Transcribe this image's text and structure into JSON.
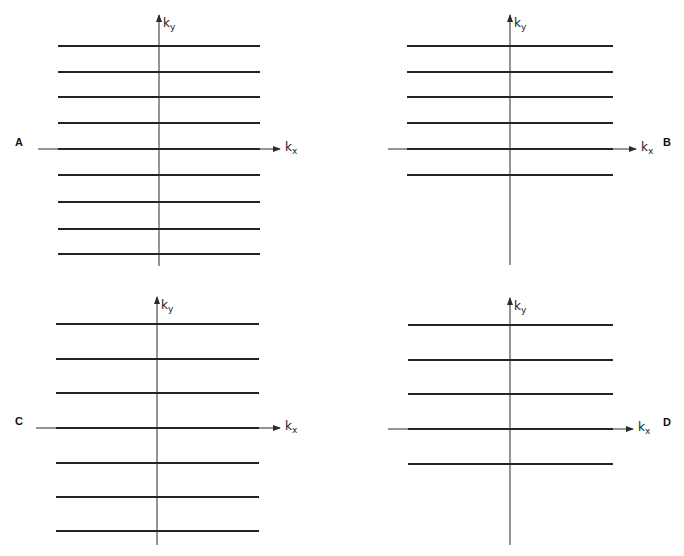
{
  "figure": {
    "axis_labels": {
      "x_main": "k",
      "x_sub": "x",
      "y_main": "k",
      "y_sub": "y"
    },
    "colors": {
      "line": "#232323",
      "axis": "#2a2a2a",
      "background": "#ffffff"
    }
  },
  "panels": [
    {
      "id": "A",
      "letter": "A",
      "letter_side": "left",
      "origin": [
        159,
        149
      ],
      "line_x_range": [
        58,
        260
      ],
      "axis_x_range": [
        38,
        280
      ],
      "axis_y_range": [
        15,
        266
      ],
      "line_y": [
        46,
        72,
        97,
        123,
        149,
        175,
        202,
        229,
        254
      ],
      "line_count": 9,
      "spacing": "narrow",
      "coverage": "full (symmetric)"
    },
    {
      "id": "B",
      "letter": "B",
      "letter_side": "right",
      "origin": [
        510,
        149
      ],
      "line_x_range": [
        407,
        613
      ],
      "axis_x_range": [
        388,
        636
      ],
      "axis_y_range": [
        15,
        265
      ],
      "line_y": [
        46,
        72,
        97,
        123,
        149,
        175
      ],
      "line_count": 6,
      "spacing": "narrow",
      "coverage": "partial (upper half plus one line)"
    },
    {
      "id": "C",
      "letter": "C",
      "letter_side": "left",
      "origin": [
        157,
        428
      ],
      "line_x_range": [
        56,
        259
      ],
      "axis_x_range": [
        36,
        280
      ],
      "axis_y_range": [
        297,
        545
      ],
      "line_y": [
        324,
        359,
        393,
        428,
        463,
        497,
        531
      ],
      "line_count": 7,
      "spacing": "wide",
      "coverage": "full (symmetric)"
    },
    {
      "id": "D",
      "letter": "D",
      "letter_side": "right",
      "origin": [
        510,
        429
      ],
      "line_x_range": [
        408,
        613
      ],
      "axis_x_range": [
        388,
        633
      ],
      "axis_y_range": [
        298,
        545
      ],
      "line_y": [
        325,
        360,
        394,
        429,
        464
      ],
      "line_count": 5,
      "spacing": "wide",
      "coverage": "partial (upper half plus one line)"
    }
  ]
}
